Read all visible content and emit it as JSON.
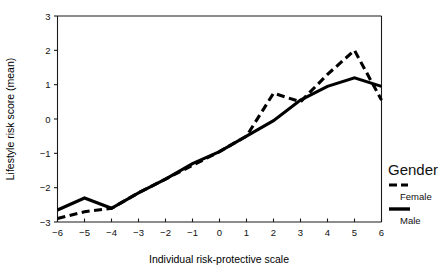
{
  "chart_data": {
    "type": "line",
    "title": "",
    "xlabel": "Individual risk-protective scale",
    "ylabel": "Lifestyle risk score (mean)",
    "x": [
      -6,
      -5,
      -4,
      -3,
      -2,
      -1,
      0,
      1,
      2,
      3,
      4,
      5,
      6
    ],
    "xticklabels": [
      "−6",
      "−5",
      "−4",
      "−3",
      "−2",
      "−1",
      "0",
      "1",
      "2",
      "3",
      "4",
      "5",
      "6"
    ],
    "yticks": [
      -3,
      -2,
      -1,
      0,
      1,
      2,
      3
    ],
    "yticklabels": [
      "−3",
      "−2",
      "−1",
      "0",
      "1",
      "2",
      "3"
    ],
    "xlim": [
      -6,
      6
    ],
    "ylim": [
      -3,
      3
    ],
    "grid": false,
    "legend_position": "right",
    "legend_title": "Gender",
    "series": [
      {
        "name": "Female",
        "style": "dashed",
        "color": "#000000",
        "values": [
          -2.9,
          -2.7,
          -2.6,
          -2.15,
          -1.75,
          -1.35,
          -0.95,
          -0.5,
          0.75,
          0.5,
          1.3,
          2.0,
          0.55
        ]
      },
      {
        "name": "Male",
        "style": "solid",
        "color": "#000000",
        "values": [
          -2.65,
          -2.3,
          -2.6,
          -2.15,
          -1.75,
          -1.3,
          -0.95,
          -0.5,
          -0.05,
          0.55,
          0.95,
          1.2,
          0.95
        ]
      }
    ]
  },
  "legend": {
    "title": "Gender",
    "entries": [
      {
        "label": "Female",
        "swatch": "dashed-line-icon"
      },
      {
        "label": "Male",
        "swatch": "solid-line-icon"
      }
    ]
  },
  "axes": {
    "x_title": "Individual risk-protective scale",
    "y_title": "Lifestyle risk score (mean)"
  }
}
